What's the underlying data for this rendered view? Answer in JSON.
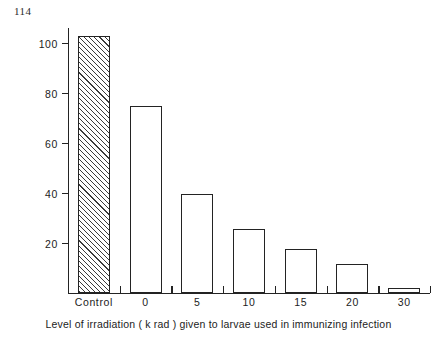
{
  "page": {
    "page_number": "114"
  },
  "chart_data": {
    "type": "bar",
    "title": "",
    "subtitle": "",
    "xlabel": "Level of irradiation ( k rad ) given to larvae used in immunizing infection",
    "ylabel": "Mean no of worms recovered at day 35",
    "categories": [
      "Control",
      "0",
      "5",
      "10",
      "15",
      "20",
      "30"
    ],
    "values": [
      103,
      75,
      39.5,
      25.5,
      17.5,
      11.5,
      2
    ],
    "series": [
      {
        "name": "Mean no of worms recovered at day 35",
        "values": [
          103,
          75,
          39.5,
          25.5,
          17.5,
          11.5,
          2
        ]
      }
    ],
    "bar_styles": [
      "hatched",
      "open",
      "open",
      "open",
      "open",
      "open",
      "open"
    ],
    "ylim": [
      0,
      106
    ],
    "yticks": [
      20,
      40,
      60,
      80,
      100
    ],
    "ytick_labels": [
      "20",
      "40",
      "60",
      "80",
      "100"
    ],
    "xtick_labels": [
      "Control",
      "0",
      "5",
      "10",
      "15",
      "20",
      "30"
    ],
    "grid": false,
    "legend": "none",
    "colors": {
      "line": "#232323",
      "bar_fill": "#ffffff",
      "hatch": "#3a3a3a",
      "background": "#ffffff",
      "text": "#1c1c1c"
    }
  }
}
